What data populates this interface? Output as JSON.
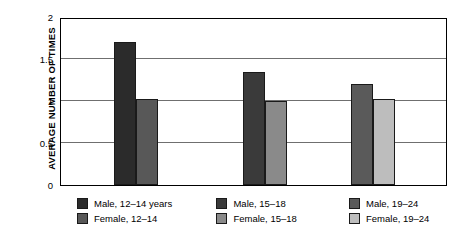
{
  "chart_data": {
    "type": "bar",
    "title": "",
    "subtitle": "",
    "xlabel": "",
    "ylabel": "AVERAGE NUMBER OF TIMES",
    "ylim": [
      0,
      2
    ],
    "yticks": [
      "0",
      "0.5",
      "1",
      "1.5",
      "2"
    ],
    "ytick_values": [
      0,
      0.5,
      1,
      1.5,
      2
    ],
    "grid": true,
    "xticks": [],
    "legend_position": "below",
    "categories": [
      "12–14 years",
      "15–18",
      "19–24"
    ],
    "series": [
      {
        "name": "Male",
        "values": [
          1.7,
          1.35,
          1.2
        ],
        "colors": [
          "#2b2b2b",
          "#3a3a3a",
          "#5a5a5a"
        ]
      },
      {
        "name": "Female",
        "values": [
          1.02,
          1.0,
          1.02
        ],
        "colors": [
          "#585858",
          "#8a8a8a",
          "#bdbdbd"
        ]
      }
    ],
    "bars": [
      {
        "label": "Male, 12–14 years",
        "value": 1.7,
        "color": "#2b2b2b"
      },
      {
        "label": "Female, 12–14",
        "value": 1.02,
        "color": "#585858"
      },
      {
        "label": "Male, 15–18",
        "value": 1.35,
        "color": "#3a3a3a"
      },
      {
        "label": "Female, 15–18",
        "value": 1.0,
        "color": "#8a8a8a"
      },
      {
        "label": "Male, 19–24",
        "value": 1.2,
        "color": "#5a5a5a"
      },
      {
        "label": "Female, 19–24",
        "value": 1.02,
        "color": "#bdbdbd"
      }
    ],
    "legend": [
      {
        "label": "Male, 12–14 years",
        "color": "#2b2b2b"
      },
      {
        "label": "Female, 12–14",
        "color": "#585858"
      },
      {
        "label": "Male, 15–18",
        "color": "#3a3a3a"
      },
      {
        "label": "Female, 15–18",
        "color": "#8a8a8a"
      },
      {
        "label": "Male, 19–24",
        "color": "#5a5a5a"
      },
      {
        "label": "Female, 19–24",
        "color": "#bdbdbd"
      }
    ]
  },
  "axis": {
    "y_title": "AVERAGE NUMBER OF TIMES",
    "ticks": [
      "2",
      "1.5",
      "1",
      "0.5",
      "0"
    ]
  }
}
